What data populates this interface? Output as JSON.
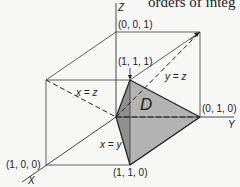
{
  "header_text": "orders of integ",
  "axes": {
    "x": "X",
    "y": "Y",
    "z": "Z"
  },
  "points": {
    "p001": "(0, 0, 1)",
    "p111": "(1, 1, 1)",
    "p010": "(0, 1, 0)",
    "p100": "(1, 0, 0)",
    "p110": "(1, 1, 0)"
  },
  "planes": {
    "yz": "y = z",
    "xz": "x = z",
    "xy": "x = y"
  },
  "region_label": "D",
  "colors": {
    "line": "#333333",
    "region_light": "#b0b0b0",
    "region_dark": "#8c8c8c",
    "background": "#f7f7f5"
  }
}
